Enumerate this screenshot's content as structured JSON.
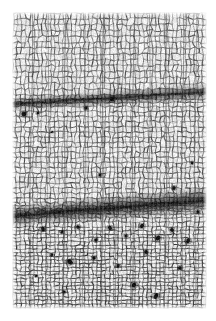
{
  "figure": {
    "kind": "light-micrograph",
    "caption": "",
    "background_color": "#ffffff",
    "canvas": {
      "width": 216,
      "height": 321
    },
    "plate_area": {
      "x": 13,
      "y": 13,
      "width": 193,
      "height": 295
    },
    "margins": {
      "left": 13,
      "top": 13,
      "right": 10,
      "bottom": 13
    }
  },
  "palette": {
    "paper": "#ffffff",
    "cell_lumen": "#f4f4f4",
    "cell_wall_light": "#a8a8a8",
    "cell_wall_mid": "#6e6e6e",
    "cell_wall_dark": "#3a3a3a",
    "ray_line": "#555555",
    "band_dark": "#2b2b2b",
    "inclusion": "#141414",
    "vignette": "#cfcfcf"
  },
  "tissue": {
    "description": "polygonal cell mesh in vertical files",
    "cell_columns": 46,
    "cell_rows": 58,
    "column_width_px": 4.2,
    "row_height_px": 5.1,
    "wall_thickness_px": 0.9,
    "jitter": 0.38,
    "seed": 20240517
  },
  "growth_bands": [
    {
      "name": "upper-latewood-band",
      "y_left": 104,
      "y_right": 92,
      "thickness_left": 7,
      "thickness_right": 9,
      "darkness": 0.72,
      "compression": 0.42
    },
    {
      "name": "lower-latewood-band",
      "y_left": 216,
      "y_right": 200,
      "thickness_left": 11,
      "thickness_right": 14,
      "darkness": 0.86,
      "compression": 0.55
    }
  ],
  "rays": [
    {
      "x_top": 32,
      "x_bottom": 30,
      "weight": 1.5
    },
    {
      "x_top": 49,
      "x_bottom": 46,
      "weight": 1.1
    },
    {
      "x_top": 66,
      "x_bottom": 63,
      "weight": 1.7
    },
    {
      "x_top": 86,
      "x_bottom": 83,
      "weight": 1.2
    },
    {
      "x_top": 104,
      "x_bottom": 101,
      "weight": 1.9
    },
    {
      "x_top": 118,
      "x_bottom": 116,
      "weight": 1.3
    },
    {
      "x_top": 134,
      "x_bottom": 132,
      "weight": 1.6
    },
    {
      "x_top": 150,
      "x_bottom": 148,
      "weight": 1.2
    },
    {
      "x_top": 167,
      "x_bottom": 165,
      "weight": 1.8
    },
    {
      "x_top": 183,
      "x_bottom": 182,
      "weight": 1.4
    },
    {
      "x_top": 196,
      "x_bottom": 195,
      "weight": 1.1
    }
  ],
  "inclusions": [
    {
      "x": 112,
      "y": 99,
      "r": 2.6
    },
    {
      "x": 86,
      "y": 108,
      "r": 1.9
    },
    {
      "x": 24,
      "y": 114,
      "r": 2.2
    },
    {
      "x": 38,
      "y": 113,
      "r": 1.5
    },
    {
      "x": 100,
      "y": 175,
      "r": 1.4
    },
    {
      "x": 174,
      "y": 188,
      "r": 1.8
    },
    {
      "x": 43,
      "y": 229,
      "r": 2.4
    },
    {
      "x": 62,
      "y": 232,
      "r": 1.7
    },
    {
      "x": 78,
      "y": 227,
      "r": 2.1
    },
    {
      "x": 96,
      "y": 240,
      "r": 1.6
    },
    {
      "x": 110,
      "y": 228,
      "r": 2.3
    },
    {
      "x": 126,
      "y": 236,
      "r": 1.9
    },
    {
      "x": 142,
      "y": 226,
      "r": 2.0
    },
    {
      "x": 158,
      "y": 238,
      "r": 2.5
    },
    {
      "x": 172,
      "y": 230,
      "r": 1.8
    },
    {
      "x": 188,
      "y": 241,
      "r": 2.2
    },
    {
      "x": 52,
      "y": 255,
      "r": 1.6
    },
    {
      "x": 70,
      "y": 262,
      "r": 2.7
    },
    {
      "x": 94,
      "y": 258,
      "r": 1.5
    },
    {
      "x": 118,
      "y": 266,
      "r": 1.9
    },
    {
      "x": 146,
      "y": 252,
      "r": 1.7
    },
    {
      "x": 180,
      "y": 268,
      "r": 2.0
    },
    {
      "x": 36,
      "y": 276,
      "r": 1.4
    },
    {
      "x": 134,
      "y": 285,
      "r": 2.1
    },
    {
      "x": 156,
      "y": 296,
      "r": 2.6
    },
    {
      "x": 64,
      "y": 292,
      "r": 1.5
    },
    {
      "x": 198,
      "y": 212,
      "r": 1.8
    },
    {
      "x": 192,
      "y": 163,
      "r": 1.3
    },
    {
      "x": 52,
      "y": 132,
      "r": 1.2
    }
  ],
  "regions": [
    {
      "name": "upper-earlywood",
      "y_from": 13,
      "y_to": 96,
      "cell_scale": 1.15,
      "tone": 0.3
    },
    {
      "name": "mid-earlywood",
      "y_from": 112,
      "y_to": 200,
      "cell_scale": 1.0,
      "tone": 0.34
    },
    {
      "name": "lower-latewood",
      "y_from": 226,
      "y_to": 308,
      "cell_scale": 0.72,
      "tone": 0.48
    }
  ]
}
